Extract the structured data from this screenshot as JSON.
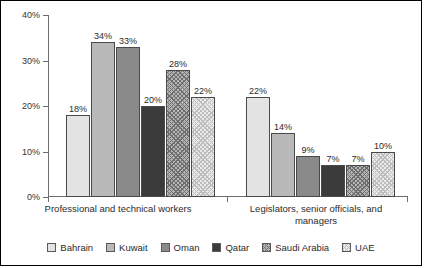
{
  "chart_data": {
    "type": "bar",
    "title": "",
    "xlabel": "",
    "ylabel": "",
    "ylim": [
      0,
      40
    ],
    "yticks": [
      "0%",
      "10%",
      "20%",
      "30%",
      "40%"
    ],
    "grid": false,
    "legend_position": "bottom",
    "categories": [
      "Professional and technical workers",
      "Legislators, senior officials, and managers"
    ],
    "category_lines": [
      [
        "Professional and technical workers"
      ],
      [
        "Legislators, senior officials, and",
        "managers"
      ]
    ],
    "series": [
      {
        "name": "Bahrain",
        "values": [
          18,
          22
        ],
        "labels": [
          "18%",
          "22%"
        ],
        "color": "#e3e3e3",
        "pattern": "solid"
      },
      {
        "name": "Kuwait",
        "values": [
          34,
          14
        ],
        "labels": [
          "34%",
          "14%"
        ],
        "color": "#b9b9b9",
        "pattern": "solid"
      },
      {
        "name": "Oman",
        "values": [
          33,
          9
        ],
        "labels": [
          "33%",
          "9%"
        ],
        "color": "#8a8a8a",
        "pattern": "solid"
      },
      {
        "name": "Qatar",
        "values": [
          20,
          7
        ],
        "labels": [
          "20%",
          "7%"
        ],
        "color": "#3b3b3b",
        "pattern": "solid"
      },
      {
        "name": "Saudi Arabia",
        "values": [
          28,
          7
        ],
        "labels": [
          "28%",
          "7%"
        ],
        "color": "#b5b5b5",
        "pattern": "crosshatch"
      },
      {
        "name": "UAE",
        "values": [
          22,
          10
        ],
        "labels": [
          "22%",
          "10%"
        ],
        "color": "#eaeaea",
        "pattern": "fine-crosshatch"
      }
    ]
  },
  "legend": {
    "items": [
      {
        "label": "Bahrain"
      },
      {
        "label": "Kuwait"
      },
      {
        "label": "Oman"
      },
      {
        "label": "Qatar"
      },
      {
        "label": "Saudi Arabia"
      },
      {
        "label": "UAE"
      }
    ]
  },
  "axis": {
    "y_tick_labels": [
      "40%",
      "30%",
      "20%",
      "10%",
      "0%"
    ]
  }
}
